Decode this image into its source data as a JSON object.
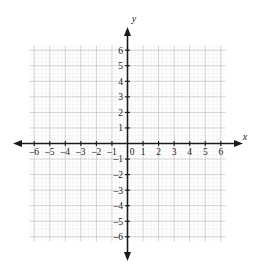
{
  "figure": {
    "kind": "cartesian-coordinate-grid",
    "background_color": "#ffffff",
    "axis_color": "#1a1a1a",
    "major_grid_color": "#c9c9c9",
    "minor_grid_color": "#dcdcdc",
    "label_color": "#1a1a1a"
  },
  "axes": {
    "x_label": "x",
    "y_label": "y",
    "origin_label": "0"
  },
  "chart_data": {
    "type": "scatter",
    "title": "",
    "xlabel": "x",
    "ylabel": "y",
    "xlim": [
      -6.3,
      6.3
    ],
    "ylim": [
      -6.3,
      6.3
    ],
    "grid": true,
    "minor_grid": true,
    "minor_ticks_per_unit": 4,
    "legend": "none",
    "series": [],
    "x_tick_labels": [
      "–6",
      "–5",
      "–4",
      "–3",
      "–2",
      "–1",
      "0",
      "1",
      "2",
      "3",
      "4",
      "5",
      "6"
    ],
    "x_tick_values": [
      -6,
      -5,
      -4,
      -3,
      -2,
      -1,
      0,
      1,
      2,
      3,
      4,
      5,
      6
    ],
    "y_tick_labels": [
      "6",
      "5",
      "4",
      "3",
      "2",
      "1",
      "–1",
      "–2",
      "–3",
      "–4",
      "–5",
      "–6"
    ],
    "y_tick_values": [
      6,
      5,
      4,
      3,
      2,
      1,
      -1,
      -2,
      -3,
      -4,
      -5,
      -6
    ]
  }
}
